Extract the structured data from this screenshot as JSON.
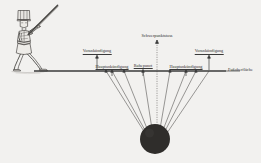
{
  "figure": {
    "type": "technical-diagram",
    "style": "historical engraving",
    "background_color": "#f2f1ef",
    "ink_color": "#3a3a3a",
    "ball_color": "#2a2a2a"
  },
  "person": {
    "name": "soldier-with-pole",
    "description": "standing figure holding a long diagonal pole"
  },
  "ground": {
    "label": "Fußoberfläche",
    "y": 71,
    "x_start": 34,
    "x_end": 226
  },
  "ball": {
    "name": "ball",
    "cx": 155,
    "cy": 139,
    "r": 15
  },
  "markers": [
    {
      "id": "vorankuendigung-left",
      "label": "Vorankündigung",
      "x": 97,
      "label_y": 51,
      "arrow_top": 56,
      "arrow_bottom": 70,
      "underline": true
    },
    {
      "id": "hauptankuendigung-left",
      "label": "Hauptankündigung",
      "x": 112,
      "label_y": 67,
      "arrow_top": 70,
      "arrow_bottom": 76,
      "underline": true
    },
    {
      "id": "ruhepunct",
      "label": "Ruhepunct",
      "x": 143,
      "label_y": 66,
      "arrow_top": 69,
      "arrow_bottom": 76,
      "underline": true
    },
    {
      "id": "schwerpunktstoss",
      "label": "Schwerpunktstoss",
      "x": 157,
      "label_y": 36,
      "arrow_top": 40,
      "arrow_bottom": 71,
      "underline": false
    },
    {
      "id": "hauptankuendigung-right",
      "label": "Hauptankündigung",
      "x": 186,
      "label_y": 67,
      "arrow_top": 70,
      "arrow_bottom": 76,
      "underline": true
    },
    {
      "id": "vorankuendigung-right",
      "label": "Vorankündigung",
      "x": 209,
      "label_y": 51,
      "arrow_top": 56,
      "arrow_bottom": 70,
      "underline": true
    }
  ],
  "converging_lines": [
    {
      "id": "ray-1",
      "x_top": 106,
      "x_bottom": 145
    },
    {
      "id": "ray-2",
      "x_top": 124,
      "x_bottom": 148
    },
    {
      "id": "ray-3",
      "x_top": 143,
      "x_bottom": 152
    },
    {
      "id": "ray-4",
      "x_top": 160,
      "x_bottom": 158
    },
    {
      "id": "ray-5",
      "x_top": 186,
      "x_bottom": 162
    },
    {
      "id": "ray-6",
      "x_top": 209,
      "x_bottom": 166
    }
  ],
  "center_axis": {
    "id": "center-dotted-axis",
    "x": 157,
    "y_top": 40,
    "y_bottom": 139,
    "style": "dotted"
  }
}
